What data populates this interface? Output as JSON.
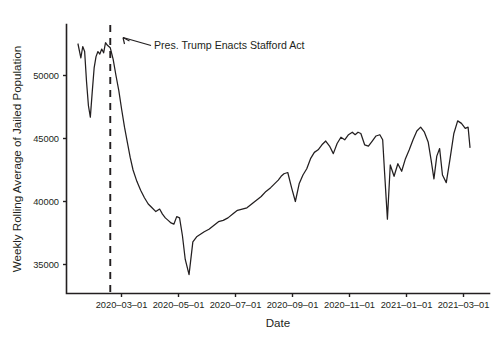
{
  "chart_data": {
    "type": "line",
    "title": "",
    "xlabel": "Date",
    "ylabel": "Weekly Rolling Average of Jailed Population",
    "grid": false,
    "legend": null,
    "xtick_labels": [
      "2020–03–01",
      "2020–05–01",
      "2020–07–01",
      "2020–09–01",
      "2020–11–01",
      "2021–01–01",
      "2021–03–01"
    ],
    "ytick_labels": [
      "35000",
      "40000",
      "45000",
      "50000"
    ],
    "ytick_values": [
      35000,
      40000,
      45000,
      50000
    ],
    "ylim": [
      33700,
      53400
    ],
    "xlim": [
      "2020-02-08",
      "2021-03-27"
    ],
    "annotations": [
      {
        "text": "Pres. Trump Enacts Stafford Act",
        "target_x": "2020-03-13",
        "kind": "vertical-dashed-line-with-arrow-label"
      }
    ],
    "series": [
      {
        "name": "Weekly Rolling Average of Jailed Population",
        "color": "#231f20",
        "x": [
          "2020-02-08",
          "2020-02-11",
          "2020-02-13",
          "2020-02-15",
          "2020-02-17",
          "2020-02-19",
          "2020-02-21",
          "2020-02-23",
          "2020-02-25",
          "2020-02-27",
          "2020-02-29",
          "2020-03-02",
          "2020-03-04",
          "2020-03-06",
          "2020-03-08",
          "2020-03-10",
          "2020-03-13",
          "2020-03-16",
          "2020-03-19",
          "2020-03-22",
          "2020-03-25",
          "2020-03-28",
          "2020-03-31",
          "2020-04-03",
          "2020-04-06",
          "2020-04-10",
          "2020-04-14",
          "2020-04-18",
          "2020-04-22",
          "2020-04-26",
          "2020-04-30",
          "2020-05-04",
          "2020-05-07",
          "2020-05-10",
          "2020-05-13",
          "2020-05-16",
          "2020-05-19",
          "2020-05-22",
          "2020-05-25",
          "2020-05-28",
          "2020-05-31",
          "2020-06-04",
          "2020-06-08",
          "2020-06-12",
          "2020-06-16",
          "2020-06-20",
          "2020-06-25",
          "2020-06-30",
          "2020-07-05",
          "2020-07-10",
          "2020-07-15",
          "2020-07-20",
          "2020-07-25",
          "2020-07-30",
          "2020-08-04",
          "2020-08-09",
          "2020-08-14",
          "2020-08-19",
          "2020-08-24",
          "2020-08-29",
          "2020-09-02",
          "2020-09-06",
          "2020-09-09",
          "2020-09-12",
          "2020-09-16",
          "2020-09-20",
          "2020-09-24",
          "2020-09-28",
          "2020-10-02",
          "2020-10-06",
          "2020-10-10",
          "2020-10-14",
          "2020-10-18",
          "2020-10-22",
          "2020-10-26",
          "2020-10-30",
          "2020-11-03",
          "2020-11-07",
          "2020-11-11",
          "2020-11-15",
          "2020-11-19",
          "2020-11-23",
          "2020-11-26",
          "2020-11-29",
          "2020-12-02",
          "2020-12-06",
          "2020-12-10",
          "2020-12-14",
          "2020-12-18",
          "2020-12-22",
          "2020-12-25",
          "2020-12-27",
          "2020-12-30",
          "2021-01-02",
          "2021-01-06",
          "2021-01-10",
          "2021-01-14",
          "2021-01-18",
          "2021-01-22",
          "2021-01-26",
          "2021-01-30",
          "2021-02-03",
          "2021-02-07",
          "2021-02-11",
          "2021-02-14",
          "2021-02-17",
          "2021-02-20",
          "2021-02-23",
          "2021-02-26",
          "2021-03-02",
          "2021-03-06",
          "2021-03-10",
          "2021-03-14",
          "2021-03-18",
          "2021-03-22",
          "2021-03-25",
          "2021-03-27"
        ],
        "values": [
          52500,
          51400,
          52300,
          51900,
          49500,
          47600,
          46700,
          48700,
          50600,
          51500,
          51900,
          51700,
          52100,
          51800,
          52600,
          52400,
          52200,
          51300,
          50000,
          48800,
          47300,
          45900,
          44700,
          43500,
          42500,
          41600,
          40900,
          40300,
          39800,
          39500,
          39200,
          39400,
          39000,
          38700,
          38500,
          38300,
          38200,
          38800,
          38700,
          37300,
          35400,
          34200,
          36800,
          37200,
          37400,
          37600,
          37800,
          38100,
          38400,
          38500,
          38700,
          39000,
          39300,
          39400,
          39500,
          39800,
          40100,
          40400,
          40800,
          41100,
          41400,
          41700,
          42000,
          42200,
          42300,
          41100,
          40000,
          41400,
          42100,
          42600,
          43400,
          43900,
          44100,
          44500,
          44800,
          44400,
          43800,
          44600,
          45100,
          44900,
          45300,
          45500,
          45300,
          45500,
          45400,
          44500,
          44400,
          44800,
          45200,
          45300,
          44900,
          42300,
          38600,
          42900,
          42000,
          43000,
          42400,
          43400,
          44100,
          44900,
          45600,
          45900,
          45500,
          44700,
          43300,
          41800,
          43600,
          44200,
          42100,
          41500,
          43400,
          45400,
          46400,
          46200,
          45800,
          45900,
          44300
        ]
      }
    ]
  },
  "axis_titles": {
    "x": "Date",
    "y": "Weekly Rolling Average of Jailed Population"
  },
  "annotation": {
    "label": "Pres. Trump Enacts Stafford Act"
  },
  "colors": {
    "line": "#231f20",
    "axis": "#231f20",
    "background": "#ffffff"
  }
}
